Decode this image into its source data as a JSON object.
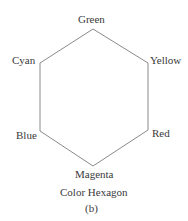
{
  "diagram": {
    "title": "Color Hexagon",
    "subtitle": "(b)",
    "vertices": [
      {
        "label": "Green",
        "x": 93,
        "y": 29
      },
      {
        "label": "Yellow",
        "x": 148,
        "y": 63
      },
      {
        "label": "Red",
        "x": 148,
        "y": 130
      },
      {
        "label": "Magenta",
        "x": 93,
        "y": 166
      },
      {
        "label": "Blue",
        "x": 40,
        "y": 131
      },
      {
        "label": "Cyan",
        "x": 40,
        "y": 63
      }
    ],
    "line_color": "#8a8a8a"
  }
}
